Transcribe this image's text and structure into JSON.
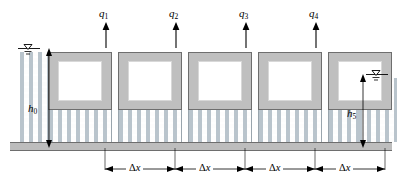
{
  "figure": {
    "width": 397,
    "height": 184
  },
  "recharge": {
    "arrow_icon": "up-arrow-icon",
    "items": [
      {
        "id": "q1",
        "label": "q",
        "sub": "1",
        "x": 105
      },
      {
        "id": "q2",
        "label": "q",
        "sub": "2",
        "x": 175
      },
      {
        "id": "q3",
        "label": "q",
        "sub": "3",
        "x": 245
      },
      {
        "id": "q4",
        "label": "q",
        "sub": "4",
        "x": 315
      }
    ]
  },
  "heads": {
    "left": {
      "id": "h0",
      "label": "h",
      "sub": "0"
    },
    "right": {
      "id": "h5",
      "label": "h",
      "sub": "5"
    }
  },
  "water_table": {
    "icon": "water-table-triangle-icon",
    "left_label": "water-table-left",
    "right_label": "water-table-right"
  },
  "dimensions": {
    "symbol": "Δ",
    "variable": "x",
    "spans": [
      {
        "id": "dx1",
        "from": 105,
        "to": 175
      },
      {
        "id": "dx2",
        "from": 175,
        "to": 245
      },
      {
        "id": "dx3",
        "from": 245,
        "to": 315
      },
      {
        "id": "dx4",
        "from": 315,
        "to": 385
      }
    ]
  },
  "cells": [
    {
      "id": "cell-1",
      "x": 48,
      "width": 64
    },
    {
      "id": "cell-2",
      "x": 118,
      "width": 64
    },
    {
      "id": "cell-3",
      "x": 188,
      "width": 64
    },
    {
      "id": "cell-4",
      "x": 258,
      "width": 64
    },
    {
      "id": "cell-5",
      "x": 328,
      "width": 64
    }
  ],
  "colors": {
    "cell_border": "#6e6e6e",
    "cell_fill": "#bfbfbf",
    "cell_inner": "#ffffff",
    "soil_stipple": "#b9c4cc",
    "base_fill": "#bdbdbd",
    "ink": "#000000"
  }
}
